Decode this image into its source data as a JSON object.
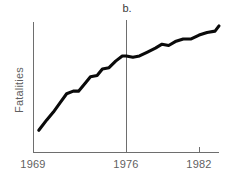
{
  "chart_data": {
    "type": "line",
    "title": "",
    "panel_label": "b.",
    "xlabel": "",
    "ylabel": "Fatalities",
    "grid": false,
    "legend": null,
    "xlim": [
      1969,
      1983
    ],
    "ylim": [
      0,
      100
    ],
    "xticks": [
      "1969",
      "1976",
      "1982"
    ],
    "xtick_values": [
      1969,
      1976,
      1982
    ],
    "yticks": [],
    "annotations": [
      {
        "label": "b.",
        "type": "panel-label",
        "x": 1976
      },
      {
        "label": "",
        "type": "vertical-reference-line",
        "x": 1976
      }
    ],
    "series": [
      {
        "name": "Fatalities",
        "color": "#0a0a0a",
        "x": [
          1969.4,
          1970.0,
          1970.5,
          1971.0,
          1971.5,
          1972.0,
          1972.4,
          1972.9,
          1973.3,
          1973.8,
          1974.2,
          1974.7,
          1975.2,
          1975.7,
          1976.0,
          1976.5,
          1977.0,
          1977.6,
          1978.2,
          1978.7,
          1979.2,
          1979.7,
          1980.3,
          1980.9,
          1981.5,
          1982.1,
          1982.7,
          1983.0
        ],
        "values": [
          17,
          25,
          31,
          38,
          45,
          47,
          47,
          53,
          58,
          59,
          64,
          65,
          70,
          74,
          74,
          73,
          74,
          77,
          80,
          83,
          82,
          85,
          87,
          87,
          90,
          92,
          93,
          97
        ]
      }
    ]
  },
  "axes": {
    "x_axis_name": "year-axis",
    "y_axis_name": "fatalities-axis"
  }
}
